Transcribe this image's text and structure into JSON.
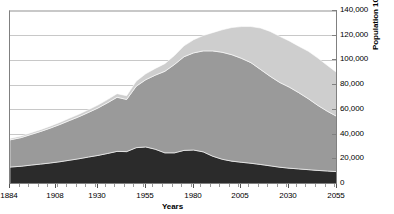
{
  "chart_data": {
    "type": "area",
    "stacked": true,
    "title": "",
    "subtitle": "",
    "xlabel": "Years",
    "ylabel": "Population 1000s",
    "xlim": [
      1884,
      2055
    ],
    "ylim": [
      0,
      140000
    ],
    "grid": true,
    "legend": "none",
    "y_ticks": [
      0,
      20000,
      40000,
      60000,
      80000,
      100000,
      120000,
      140000
    ],
    "y_tick_labels": [
      "0",
      "20,000",
      "40,000",
      "60,000",
      "80,000",
      "100,000",
      "120,000",
      "140,000"
    ],
    "x_ticks": [
      1884,
      1908,
      1930,
      1955,
      1980,
      2005,
      2030,
      2055
    ],
    "x_tick_labels": [
      "1884",
      "1908",
      "1930",
      "1955",
      "1980",
      "2005",
      "2030",
      "2055"
    ],
    "x_minor_tick_interval": 5,
    "colors": {
      "series_bottom": "#2b2b2b",
      "series_middle": "#9a9a9a",
      "series_top": "#cecece",
      "gridline": "#c8c8c8",
      "axis": "#808080",
      "background": "#ffffff"
    },
    "x": [
      1884,
      1890,
      1895,
      1900,
      1905,
      1910,
      1915,
      1920,
      1925,
      1930,
      1935,
      1940,
      1945,
      1950,
      1955,
      1960,
      1965,
      1970,
      1975,
      1980,
      1985,
      1990,
      1995,
      2000,
      2005,
      2010,
      2015,
      2020,
      2025,
      2030,
      2035,
      2040,
      2045,
      2050,
      2055
    ],
    "series": [
      {
        "name": "series_bottom",
        "color": "#2b2b2b",
        "values": [
          13700,
          14400,
          15300,
          16100,
          17000,
          18000,
          19200,
          20400,
          21800,
          23100,
          24700,
          26400,
          26200,
          29400,
          30000,
          28100,
          25200,
          25200,
          27200,
          27500,
          26000,
          22500,
          20000,
          18500,
          17600,
          16800,
          15800,
          14700,
          13600,
          12800,
          12200,
          11600,
          11000,
          10500,
          10000
        ]
      },
      {
        "name": "series_middle",
        "color": "#9a9a9a",
        "values": [
          22000,
          23200,
          24800,
          26400,
          28200,
          30100,
          32100,
          34000,
          36100,
          38400,
          41000,
          43800,
          42200,
          49700,
          54400,
          60000,
          66000,
          71500,
          75800,
          78600,
          81700,
          85200,
          86600,
          86100,
          84100,
          81400,
          76900,
          72500,
          68600,
          65600,
          61700,
          57400,
          52600,
          48300,
          44600
        ]
      },
      {
        "name": "series_top",
        "color": "#cecece",
        "values": [
          1200,
          1300,
          1400,
          1500,
          1600,
          1700,
          1850,
          2000,
          2200,
          2400,
          2600,
          2900,
          3000,
          4100,
          4800,
          5400,
          6200,
          7300,
          8800,
          10600,
          12400,
          14800,
          18200,
          22000,
          25700,
          29200,
          33500,
          36300,
          37300,
          37400,
          37600,
          38400,
          38300,
          37100,
          35400
        ]
      }
    ],
    "total_values": [
      36900,
      38900,
      41500,
      44000,
      46800,
      49800,
      53150,
      56400,
      60100,
      63900,
      68300,
      73100,
      71400,
      83200,
      89200,
      93500,
      97400,
      104000,
      111800,
      116700,
      120100,
      122500,
      124800,
      126600,
      127400,
      127400,
      126200,
      123500,
      119500,
      115800,
      111500,
      107400,
      101900,
      95900,
      90000
    ]
  }
}
